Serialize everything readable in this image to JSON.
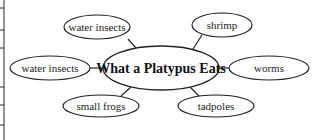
{
  "diagram": {
    "type": "concept-web",
    "center": {
      "label": "What a Platypus Eats",
      "cx": 161,
      "cy": 68,
      "rx": 58,
      "ry": 22
    },
    "nodes": [
      {
        "label": "water insects",
        "cx": 97,
        "cy": 27,
        "rx": 33,
        "ry": 12
      },
      {
        "label": "shrimp",
        "cx": 222,
        "cy": 25,
        "rx": 30,
        "ry": 12
      },
      {
        "label": "water insects",
        "cx": 50,
        "cy": 68,
        "rx": 40,
        "ry": 12
      },
      {
        "label": "worms",
        "cx": 269,
        "cy": 68,
        "rx": 40,
        "ry": 12
      },
      {
        "label": "small frogs",
        "cx": 101,
        "cy": 106,
        "rx": 38,
        "ry": 11
      },
      {
        "label": "tadpoles",
        "cx": 216,
        "cy": 106,
        "rx": 38,
        "ry": 11
      }
    ],
    "edges": [
      {
        "x1": 128,
        "y1": 39,
        "x2": 136,
        "y2": 48
      },
      {
        "x1": 202,
        "y1": 35,
        "x2": 193,
        "y2": 49
      },
      {
        "x1": 90,
        "y1": 68,
        "x2": 103,
        "y2": 68
      },
      {
        "x1": 219,
        "y1": 68,
        "x2": 229,
        "y2": 68
      },
      {
        "x1": 121,
        "y1": 96,
        "x2": 131,
        "y2": 87
      },
      {
        "x1": 199,
        "y1": 96,
        "x2": 190,
        "y2": 87
      }
    ],
    "left_margin": {
      "x": 4,
      "ticks": [
        8,
        30,
        48,
        87,
        105,
        125
      ]
    },
    "stroke_color": "#222222"
  }
}
